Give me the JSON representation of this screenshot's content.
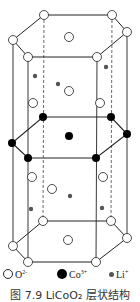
{
  "figure": {
    "type": "crystal-structure",
    "caption": "图 7.9   LiCoO₂ 层状结构",
    "colors": {
      "line": "#222222",
      "oxygen_fill": "#ffffff",
      "cobalt_fill": "#000000",
      "lithium_fill": "#555555"
    }
  },
  "legend": {
    "items": [
      {
        "symbol": "open-circle",
        "label": "O",
        "charge": "2-"
      },
      {
        "symbol": "filled-circle",
        "label": "Co",
        "charge": "3+"
      },
      {
        "symbol": "small-dot",
        "label": "Li",
        "charge": "+"
      }
    ]
  },
  "structure": {
    "layers": [
      {
        "name": "top-oxygen-layer",
        "ion": "O2-",
        "count": 7
      },
      {
        "name": "middle-cobalt-layer",
        "ion": "Co3+",
        "count": 7
      },
      {
        "name": "bottom-oxygen-layer",
        "ion": "O2-",
        "count": 7
      }
    ],
    "interlayer_oxygen_count": 6,
    "lithium_count": 6
  }
}
